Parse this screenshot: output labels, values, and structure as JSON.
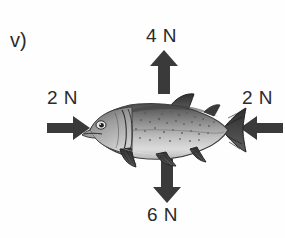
{
  "diagram": {
    "item_label": "v)",
    "background_color": "#fefefe",
    "arrow_color": "#3a3a3a",
    "text_color": "#2b2b2b",
    "forces": [
      {
        "id": "up",
        "label": "4 N",
        "magnitude": 4,
        "unit": "N",
        "direction": "up",
        "points_toward_object": true
      },
      {
        "id": "left",
        "label": "2 N",
        "magnitude": 2,
        "unit": "N",
        "direction": "right",
        "points_toward_object": true
      },
      {
        "id": "right",
        "label": "2 N",
        "magnitude": 2,
        "unit": "N",
        "direction": "left",
        "points_toward_object": true
      },
      {
        "id": "down",
        "label": "6 N",
        "magnitude": 6,
        "unit": "N",
        "direction": "down",
        "points_toward_object": true
      }
    ]
  }
}
